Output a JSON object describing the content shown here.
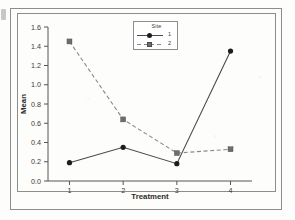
{
  "chart_data": {
    "type": "line",
    "title": "",
    "xlabel": "Treatment",
    "ylabel": "Mean",
    "categories": [
      "1",
      "2",
      "3",
      "4"
    ],
    "x": [
      1,
      2,
      3,
      4
    ],
    "xlim": [
      0.6,
      4.4
    ],
    "ylim": [
      0.0,
      1.6
    ],
    "yticks": [
      "0.0",
      "0.2",
      "0.4",
      "0.6",
      "0.8",
      "1.0",
      "1.2",
      "1.4",
      "1.6"
    ],
    "ytick_values": [
      0.0,
      0.2,
      0.4,
      0.6,
      0.8,
      1.0,
      1.2,
      1.4,
      1.6
    ],
    "xticks": [
      "1",
      "2",
      "3",
      "4"
    ],
    "grid": false,
    "legend_position": "top-center",
    "legend_title": "Site",
    "series": [
      {
        "name": "1",
        "values": [
          0.19,
          0.35,
          0.18,
          1.35
        ],
        "marker": "circle",
        "linestyle": "solid",
        "color": "#4a4a4a"
      },
      {
        "name": "2",
        "values": [
          1.45,
          0.64,
          0.29,
          0.33
        ],
        "marker": "square",
        "linestyle": "dashed",
        "color": "#8a8a8a"
      }
    ]
  },
  "legend": {
    "title": "Site",
    "entries": [
      {
        "label": "1"
      },
      {
        "label": "2"
      }
    ]
  },
  "axes": {
    "x_title": "Treatment",
    "y_title": "Mean",
    "y_labels": [
      "1.6",
      "1.4",
      "1.2",
      "1.0",
      "0.8",
      "0.6",
      "0.4",
      "0.2",
      "0.0"
    ],
    "x_labels": [
      "1",
      "2",
      "3",
      "4"
    ]
  }
}
